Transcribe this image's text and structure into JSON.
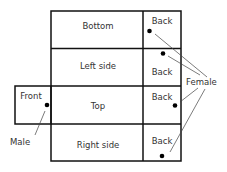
{
  "diagram": {
    "panels": [
      {
        "id": "bottom",
        "label": "Bottom"
      },
      {
        "id": "left-side",
        "label": "Left side"
      },
      {
        "id": "top",
        "label": "Top"
      },
      {
        "id": "right-side",
        "label": "Right side"
      },
      {
        "id": "front",
        "label": "Front"
      }
    ],
    "back_panels": [
      {
        "label": "Back"
      },
      {
        "label": "Back"
      },
      {
        "label": "Back"
      },
      {
        "label": "Back"
      }
    ],
    "callouts": {
      "male": "Male",
      "female": "Female"
    },
    "colors": {
      "line": "#111111",
      "text": "#333333",
      "dot": "#000000"
    }
  }
}
